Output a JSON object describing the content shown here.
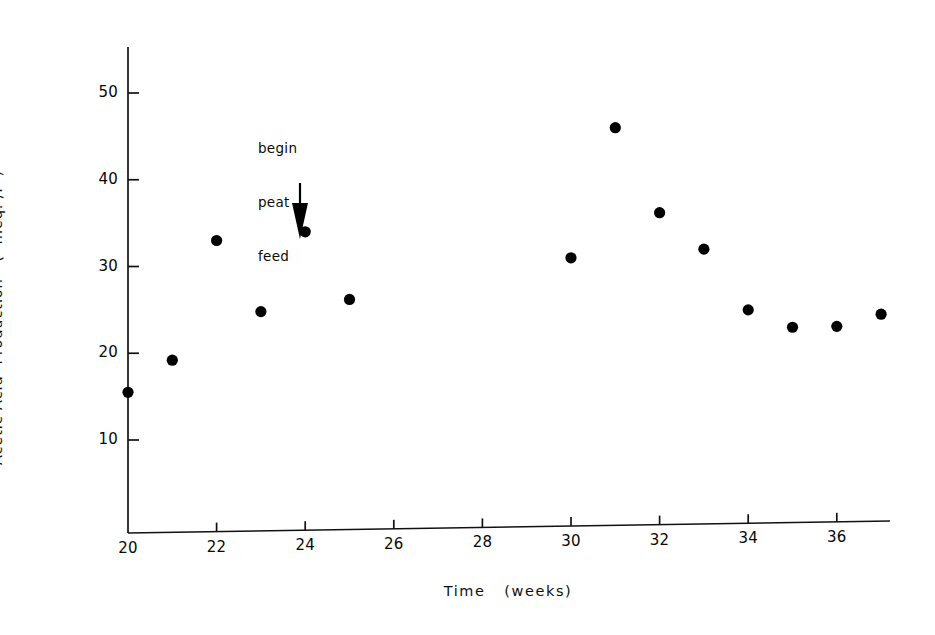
{
  "chart_data": {
    "type": "scatter",
    "title": "",
    "xlabel": "Time   (weeks)",
    "ylabel": "Acetic Acid  Production   (  meq. /l  )",
    "xlim": [
      19.2,
      37.8
    ],
    "ylim": [
      0,
      54
    ],
    "grid": false,
    "legend": null,
    "xticks": [
      20,
      22,
      24,
      26,
      28,
      30,
      32,
      34,
      36
    ],
    "xticklabels": [
      "20",
      "22",
      "24",
      "26",
      "28",
      "30",
      "32",
      "34",
      "36"
    ],
    "yticks": [
      10,
      20,
      30,
      40,
      50
    ],
    "yticklabels": [
      "10",
      "20",
      "30",
      "40",
      "50"
    ],
    "x": [
      20,
      21,
      22,
      23,
      24,
      25,
      30,
      31,
      32,
      33,
      34,
      35,
      36,
      37
    ],
    "values": [
      15.5,
      19.2,
      33.0,
      24.8,
      34.0,
      26.2,
      31.0,
      46.0,
      36.2,
      32.0,
      25.0,
      23.0,
      23.1,
      24.5
    ],
    "marker": "filled-circle",
    "marker_color": "#000000",
    "annotations": [
      {
        "text": "begin\npeat\nfeed",
        "line1": "begin",
        "line2": "peat",
        "line3": "feed",
        "arrow": "down-arrow",
        "points_to_x": 24,
        "points_to_y": 34.0
      }
    ]
  },
  "axes": {
    "y_axis_label": "Acetic Acid  Production   (  meq. /l  )",
    "x_axis_label": "Time   (weeks)"
  },
  "ticks": {
    "y": [
      {
        "label": "50",
        "value": 50
      },
      {
        "label": "40",
        "value": 40
      },
      {
        "label": "30",
        "value": 30
      },
      {
        "label": "20",
        "value": 20
      },
      {
        "label": "10",
        "value": 10
      }
    ],
    "x": [
      {
        "label": "20",
        "value": 20
      },
      {
        "label": "22",
        "value": 22
      },
      {
        "label": "24",
        "value": 24
      },
      {
        "label": "26",
        "value": 26
      },
      {
        "label": "28",
        "value": 28
      },
      {
        "label": "30",
        "value": 30
      },
      {
        "label": "32",
        "value": 32
      },
      {
        "label": "34",
        "value": 34
      },
      {
        "label": "36",
        "value": 36
      }
    ]
  },
  "annotation": {
    "line1": "begin",
    "line2": "peat",
    "line3": "feed"
  },
  "colors": {
    "ink": "#000000",
    "background": "#ffffff"
  }
}
